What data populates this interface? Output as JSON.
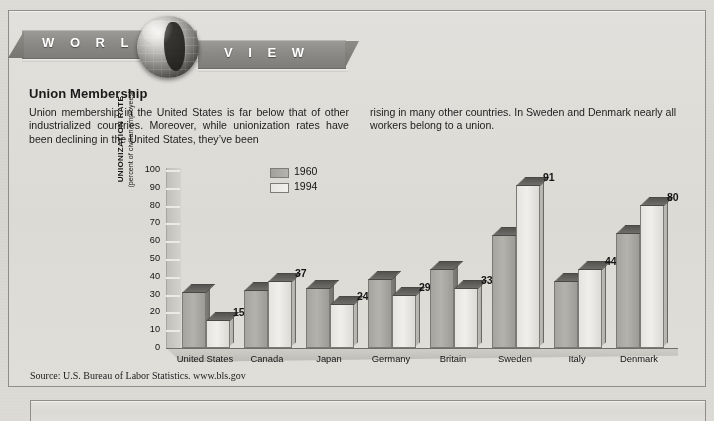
{
  "banner": {
    "word_left": "W O R L D",
    "word_right": "V I E W",
    "globe_icon": "globe-icon"
  },
  "article": {
    "headline": "Union Membership",
    "column_left": "Union membership in the United States is far below that of other industrialized countries. Moreover, while unionization rates have been declining in the United States, they’ve been",
    "column_right": "rising in many other countries. In Sweden and Denmark nearly all workers belong to a union."
  },
  "source": "Source: U.S. Bureau of Labor Statistics. www.bls.gov",
  "chart_data": {
    "type": "bar",
    "title": "Union Membership",
    "xlabel": "",
    "ylabel": "UNIONIZATION RATE",
    "ylabel_sub": "(percent of civilian employees)",
    "ylim": [
      0,
      100
    ],
    "yticks": [
      100,
      90,
      80,
      70,
      60,
      50,
      40,
      30,
      20,
      10,
      0
    ],
    "grid": false,
    "legend_position": "top-left-inside",
    "categories": [
      "United States",
      "Canada",
      "Japan",
      "Germany",
      "Britain",
      "Sweden",
      "Italy",
      "Denmark"
    ],
    "series": [
      {
        "name": "1960",
        "color": "#a6a49f",
        "values": [
          31,
          32,
          33,
          38,
          44,
          63,
          37,
          64
        ],
        "data_labels": [
          "",
          "",
          "",
          "",
          "",
          "",
          "",
          ""
        ]
      },
      {
        "name": "1994",
        "color": "#eceae6",
        "values": [
          15,
          37,
          24,
          29,
          33,
          91,
          44,
          80
        ],
        "data_labels": [
          "15",
          "37",
          "24",
          "29",
          "33",
          "91",
          "44",
          "80"
        ]
      }
    ]
  }
}
